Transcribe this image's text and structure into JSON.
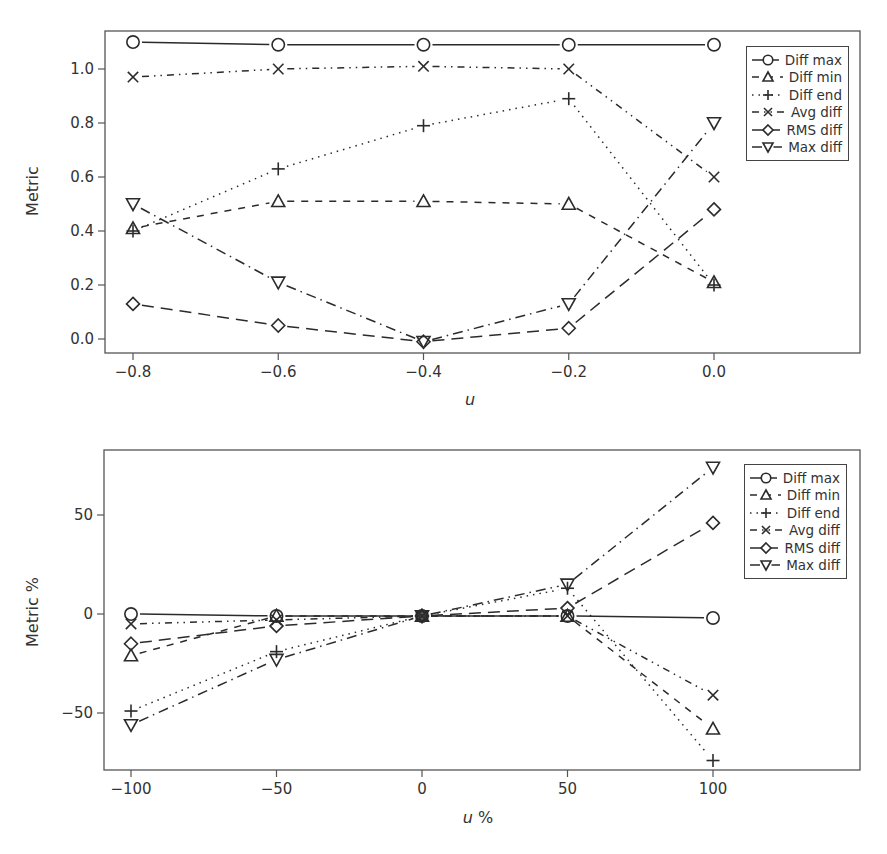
{
  "chart_data": [
    {
      "type": "line",
      "title": "",
      "xlabel": "u",
      "ylabel": "Metric",
      "x": [
        -0.8,
        -0.6,
        -0.4,
        -0.2,
        0.0
      ],
      "x_tick_labels": [
        "−0.8",
        "−0.6",
        "−0.4",
        "−0.2",
        "0.0"
      ],
      "y_ticks": [
        0.0,
        0.2,
        0.4,
        0.6,
        0.8,
        1.0
      ],
      "y_tick_labels": [
        "0.0",
        "0.2",
        "0.4",
        "0.6",
        "0.8",
        "1.0"
      ],
      "xlim": [
        -0.915,
        0.2
      ],
      "ylim": [
        -0.045,
        1.14
      ],
      "grid": false,
      "legend_position": "upper right",
      "series": [
        {
          "name": "Diff max",
          "marker": "circle",
          "linestyle": "solid",
          "values": [
            1.1,
            1.09,
            1.09,
            1.09,
            1.09
          ]
        },
        {
          "name": "Diff min",
          "marker": "triangle-up",
          "linestyle": "dashed",
          "values": [
            0.41,
            0.51,
            0.51,
            0.5,
            0.21
          ]
        },
        {
          "name": "Diff end",
          "marker": "plus",
          "linestyle": "dotted",
          "values": [
            0.4,
            0.63,
            0.79,
            0.89,
            0.2
          ]
        },
        {
          "name": "Avg diff",
          "marker": "x",
          "linestyle": "dash-dot-dot",
          "values": [
            0.97,
            1.0,
            1.01,
            1.0,
            0.6
          ]
        },
        {
          "name": "RMS diff",
          "marker": "diamond",
          "linestyle": "long-dash",
          "values": [
            0.13,
            0.05,
            -0.01,
            0.04,
            0.48
          ]
        },
        {
          "name": "Max diff",
          "marker": "triangle-down",
          "linestyle": "dash-dot",
          "values": [
            0.5,
            0.21,
            -0.01,
            0.13,
            0.8
          ]
        }
      ]
    },
    {
      "type": "line",
      "title": "",
      "xlabel": "u %",
      "ylabel": "Metric %",
      "x": [
        -100,
        -50,
        0,
        50,
        100
      ],
      "x_tick_labels": [
        "−100",
        "−50",
        "0",
        "50",
        "100"
      ],
      "y_ticks": [
        -50,
        0,
        50
      ],
      "y_tick_labels": [
        "−50",
        "0",
        "50"
      ],
      "xlim": [
        -128,
        150
      ],
      "ylim": [
        -78,
        81
      ],
      "grid": false,
      "legend_position": "upper right",
      "series": [
        {
          "name": "Diff max",
          "marker": "circle",
          "linestyle": "solid",
          "values": [
            0,
            -1,
            -1,
            -1,
            -2
          ]
        },
        {
          "name": "Diff min",
          "marker": "triangle-up",
          "linestyle": "dashed",
          "values": [
            -21,
            -1,
            -1,
            -1,
            -58
          ]
        },
        {
          "name": "Diff end",
          "marker": "plus",
          "linestyle": "dotted",
          "values": [
            -49,
            -19,
            -1,
            13,
            -74
          ]
        },
        {
          "name": "Avg diff",
          "marker": "x",
          "linestyle": "dash-dot-dot",
          "values": [
            -5,
            -3,
            -1,
            -1,
            -41
          ]
        },
        {
          "name": "RMS diff",
          "marker": "diamond",
          "linestyle": "long-dash",
          "values": [
            -15,
            -6,
            -1,
            3,
            46
          ]
        },
        {
          "name": "Max diff",
          "marker": "triangle-down",
          "linestyle": "dash-dot",
          "values": [
            -56,
            -23,
            -1,
            15,
            74
          ]
        }
      ]
    }
  ],
  "panels": [
    {
      "ylabel": "Metric",
      "xlabel_italic": "u",
      "xlabel_suffix": "",
      "legend": [
        "Diff max",
        "Diff min",
        "Diff end",
        "Avg diff",
        "RMS diff",
        "Max diff"
      ]
    },
    {
      "ylabel": "Metric %",
      "xlabel_italic": "u",
      "xlabel_suffix": " %",
      "legend": [
        "Diff max",
        "Diff min",
        "Diff end",
        "Avg diff",
        "RMS diff",
        "Max diff"
      ]
    }
  ],
  "style": {
    "line_color": "#2b2b2b",
    "frame_color": "#555555",
    "background": "#ffffff"
  }
}
